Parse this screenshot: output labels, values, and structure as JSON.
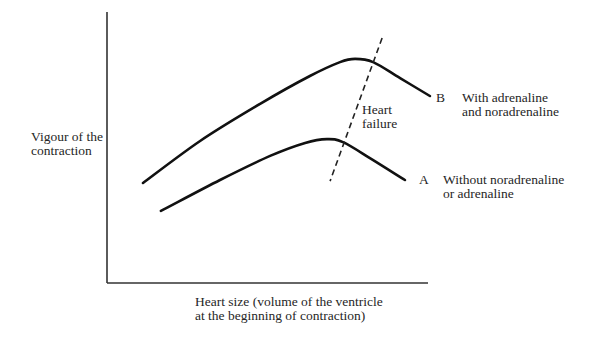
{
  "chart_data": {
    "type": "line",
    "title": "",
    "xlabel": [
      "Heart size (volume of the ventricle",
      "at the beginning of contraction)"
    ],
    "ylabel": [
      "Vigour of the",
      "contraction"
    ],
    "xlim": [
      0,
      100
    ],
    "ylim": [
      0,
      100
    ],
    "grid": false,
    "ticks": false,
    "series": [
      {
        "name": "B",
        "tag": "B",
        "description": [
          "With adrenaline",
          "and noradrenaline"
        ],
        "style": "solid",
        "color": "#111111",
        "x": [
          11.2,
          29.0,
          47.7,
          63.2,
          72.6,
          77.3,
          82.9,
          91.3,
          100.6
        ],
        "y": [
          36.9,
          52.4,
          66.1,
          76.4,
          81.5,
          82.7,
          81.5,
          75.6,
          69.0
        ]
      },
      {
        "name": "A",
        "tag": "A",
        "description": [
          "Without noradrenaline",
          "or adrenaline"
        ],
        "style": "solid",
        "color": "#111111",
        "x": [
          16.8,
          35.2,
          50.8,
          61.7,
          68.5,
          73.5,
          81.9,
          92.8
        ],
        "y": [
          26.6,
          38.0,
          46.9,
          51.7,
          53.1,
          52.0,
          46.1,
          38.0
        ]
      }
    ],
    "annotations": [
      {
        "name": "heart-failure-line",
        "text": [
          "Heart",
          "failure"
        ],
        "style": "dashed",
        "x": [
          85.7,
          69.5
        ],
        "y": [
          90.4,
          37.6
        ]
      }
    ]
  }
}
